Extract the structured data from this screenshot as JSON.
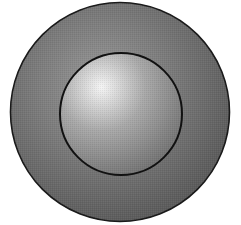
{
  "diagram": {
    "outer_circle": {
      "label": "",
      "fill_light": "#9a9a9a",
      "fill_dark": "#5a5a5a",
      "stroke": "#1a1a1a"
    },
    "inner_circle": {
      "label": "",
      "fill_highlight": "#f4f4f4",
      "fill_mid": "#a8a8a8",
      "fill_dark": "#6e6e6e",
      "stroke": "#111111"
    }
  }
}
